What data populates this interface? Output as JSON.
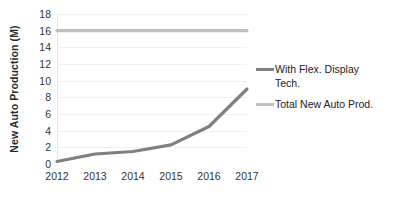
{
  "chart_data": {
    "type": "line",
    "title": "",
    "xlabel": "",
    "ylabel": "New Auto Production (M)",
    "categories": [
      "2012",
      "2013",
      "2014",
      "2015",
      "2016",
      "2017"
    ],
    "x": [
      2012,
      2013,
      2014,
      2015,
      2016,
      2017
    ],
    "series": [
      {
        "name": "With Flex. Display Tech.",
        "color": "#808080",
        "values": [
          0.3,
          1.2,
          1.5,
          2.3,
          4.5,
          9.0
        ]
      },
      {
        "name": "Total New Auto Prod.",
        "color": "#bfbfbf",
        "values": [
          16,
          16,
          16,
          16,
          16,
          16
        ]
      }
    ],
    "ylim": [
      0,
      18
    ],
    "y_ticks": [
      0,
      2,
      4,
      6,
      8,
      10,
      12,
      14,
      16,
      18
    ],
    "y_tick_labels": [
      "0",
      "2",
      "4",
      "6",
      "8",
      "10",
      "12",
      "14",
      "16",
      "18"
    ],
    "grid": true,
    "grid_axis": "y",
    "legend_position": "right"
  },
  "axes": {
    "y_title": "New Auto Production (M)"
  },
  "legend": {
    "entries": [
      {
        "label": "With Flex. Display\nTech.",
        "color": "#808080"
      },
      {
        "label": "Total New Auto Prod.",
        "color": "#bfbfbf"
      }
    ]
  },
  "colors": {
    "background": "#ffffff",
    "gridline": "#f0f0f0",
    "axis_line": "#e3e3e3",
    "tick_text": "#333333",
    "title_text": "#2b2b2b",
    "series_primary": "#808080",
    "series_secondary": "#bfbfbf"
  }
}
